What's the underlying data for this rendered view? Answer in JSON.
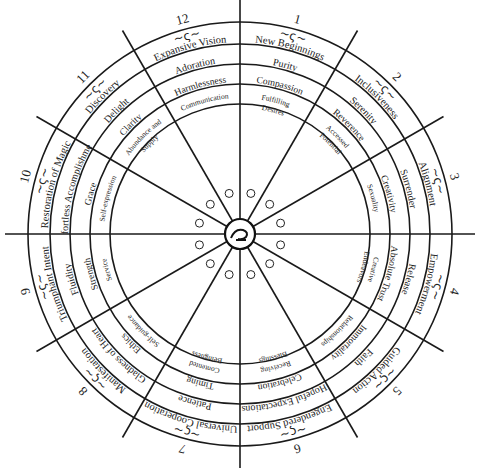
{
  "diagram": {
    "center_symbol": "sigil-icon",
    "sectors": [
      {
        "number": "1",
        "ring1": "New Beginnings",
        "ring2": "Purity",
        "ring3": "Compassion",
        "ring4": "Fulfilling Desires"
      },
      {
        "number": "2",
        "ring1": "Inclusiveness",
        "ring2": "Serenity",
        "ring3": "Reverence",
        "ring4": "Accessed Potential"
      },
      {
        "number": "3",
        "ring1": "Alignment",
        "ring2": "Surrender",
        "ring3": "Creativity",
        "ring4": "Sexuality"
      },
      {
        "number": "4",
        "ring1": "Empowerment",
        "ring2": "Release",
        "ring3": "Absolute Trust",
        "ring4": "Creative Endeavors"
      },
      {
        "number": "5",
        "ring1": "Guided Action",
        "ring2": "Faith",
        "ring3": "Immortality",
        "ring4": "Relationships"
      },
      {
        "number": "6",
        "ring1": "Engendered Support",
        "ring2": "Hopeful Expectations",
        "ring3": "Celebration",
        "ring4": "Receiving Blessings"
      },
      {
        "number": "7",
        "ring1": "Universal Cooperation",
        "ring2": "Patience",
        "ring3": "Timing",
        "ring4": "Contented Beingness"
      },
      {
        "number": "8",
        "ring1": "Manifestation",
        "ring2": "Gladness of Heart",
        "ring3": "Ethics",
        "ring4": "Self-guidance"
      },
      {
        "number": "9",
        "ring1": "Triumphant Intent",
        "ring2": "Fluidity",
        "ring3": "Strength",
        "ring4": "Service"
      },
      {
        "number": "10",
        "ring1": "Restoration of Magic",
        "ring2": "Effortless Accomplishment",
        "ring3": "Grace",
        "ring4": "Self-expression"
      },
      {
        "number": "11",
        "ring1": "Discovery",
        "ring2": "Delight",
        "ring3": "Clarity",
        "ring4": "Abundance and Supply"
      },
      {
        "number": "12",
        "ring1": "Expansive Vision",
        "ring2": "Adoration",
        "ring3": "Harmlessness",
        "ring4": "Communication"
      }
    ]
  }
}
